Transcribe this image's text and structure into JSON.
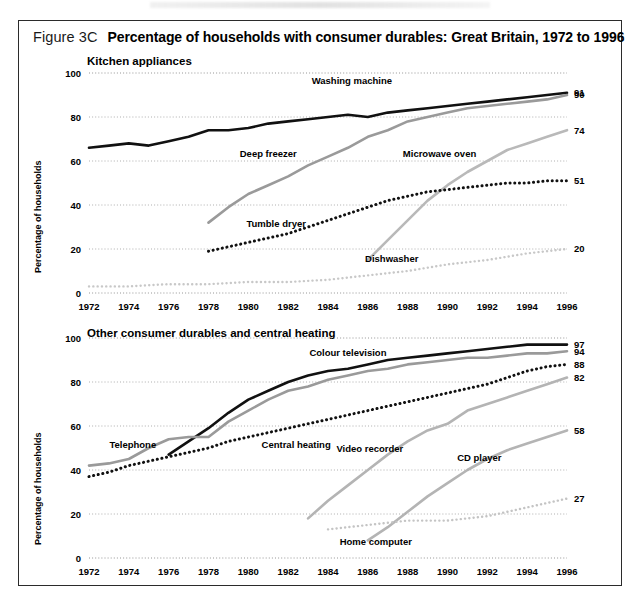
{
  "figure": {
    "number": "Figure 3C",
    "title": "Percentage of households with consumer durables: Great Britain, 1972 to 1996"
  },
  "chart_data": [
    {
      "type": "line",
      "title": "Kitchen appliances",
      "xlabel": "",
      "ylabel": "Percentage of households",
      "xlim": [
        1972,
        1996
      ],
      "ylim": [
        0,
        100
      ],
      "yticks": [
        0,
        20,
        40,
        60,
        80,
        100
      ],
      "grid": true,
      "legend": "inline-labels",
      "categories": [
        1972,
        1974,
        1976,
        1978,
        1980,
        1982,
        1984,
        1986,
        1988,
        1990,
        1992,
        1994,
        1996
      ],
      "series": [
        {
          "name": "Washing machine",
          "style": "solid-black",
          "color": "#111111",
          "end_value": 91,
          "label_x": 1985.2,
          "label_y": 95,
          "x": [
            1972,
            1973,
            1974,
            1975,
            1976,
            1977,
            1978,
            1979,
            1980,
            1981,
            1982,
            1983,
            1984,
            1985,
            1986,
            1987,
            1988,
            1989,
            1990,
            1991,
            1992,
            1993,
            1994,
            1995,
            1996
          ],
          "values": [
            66,
            67,
            68,
            67,
            69,
            71,
            74,
            74,
            75,
            77,
            78,
            79,
            80,
            81,
            80,
            82,
            83,
            84,
            85,
            86,
            87,
            88,
            89,
            90,
            91
          ]
        },
        {
          "name": "Deep freezer",
          "style": "solid-grey",
          "color": "#9a9a9a",
          "end_value": 90,
          "label_x": 1981.0,
          "label_y": 62,
          "x": [
            1978,
            1979,
            1980,
            1981,
            1982,
            1983,
            1984,
            1985,
            1986,
            1987,
            1988,
            1989,
            1990,
            1991,
            1992,
            1993,
            1994,
            1995,
            1996
          ],
          "values": [
            32,
            39,
            45,
            49,
            53,
            58,
            62,
            66,
            71,
            74,
            78,
            80,
            82,
            84,
            85,
            86,
            87,
            88,
            90
          ]
        },
        {
          "name": "Microwave oven",
          "style": "solid-lightgrey",
          "color": "#b9b9b9",
          "end_value": 74,
          "label_x": 1989.6,
          "label_y": 62,
          "x": [
            1986,
            1987,
            1988,
            1989,
            1990,
            1991,
            1992,
            1993,
            1994,
            1995,
            1996
          ],
          "values": [
            15,
            24,
            33,
            42,
            49,
            55,
            60,
            65,
            68,
            71,
            74
          ]
        },
        {
          "name": "Tumble dryer",
          "style": "dotted-black",
          "color": "#111111",
          "end_value": 51,
          "label_x": 1981.4,
          "label_y": 30,
          "x": [
            1978,
            1979,
            1980,
            1981,
            1982,
            1983,
            1984,
            1985,
            1986,
            1987,
            1988,
            1989,
            1990,
            1991,
            1992,
            1993,
            1994,
            1995,
            1996
          ],
          "values": [
            19,
            21,
            23,
            25,
            27,
            30,
            33,
            36,
            39,
            42,
            44,
            46,
            47,
            48,
            49,
            50,
            50,
            51,
            51
          ]
        },
        {
          "name": "Dishwasher",
          "style": "dotted-lightgrey",
          "color": "#c8c8c8",
          "end_value": 20,
          "label_x": 1987.2,
          "label_y": 14,
          "x": [
            1972,
            1974,
            1976,
            1978,
            1980,
            1982,
            1984,
            1986,
            1988,
            1990,
            1992,
            1994,
            1996
          ],
          "values": [
            3,
            3,
            4,
            4,
            5,
            5,
            6,
            8,
            10,
            13,
            15,
            18,
            20
          ]
        }
      ]
    },
    {
      "type": "line",
      "title": "Other consumer durables and central heating",
      "xlabel": "",
      "ylabel": "Percentage of households",
      "xlim": [
        1972,
        1996
      ],
      "ylim": [
        0,
        100
      ],
      "yticks": [
        0,
        20,
        40,
        60,
        80,
        100
      ],
      "grid": true,
      "legend": "inline-labels",
      "categories": [
        1972,
        1974,
        1976,
        1978,
        1980,
        1982,
        1984,
        1986,
        1988,
        1990,
        1992,
        1994,
        1996
      ],
      "series": [
        {
          "name": "Colour television",
          "style": "solid-black",
          "color": "#111111",
          "end_value": 97,
          "label_x": 1985.0,
          "label_y": 92,
          "x": [
            1976,
            1977,
            1978,
            1979,
            1980,
            1981,
            1982,
            1983,
            1984,
            1985,
            1986,
            1987,
            1988,
            1989,
            1990,
            1991,
            1992,
            1993,
            1994,
            1995,
            1996
          ],
          "values": [
            47,
            53,
            59,
            66,
            72,
            76,
            80,
            83,
            85,
            86,
            88,
            90,
            91,
            92,
            93,
            94,
            95,
            96,
            97,
            97,
            97
          ]
        },
        {
          "name": "Telephone",
          "style": "solid-grey",
          "color": "#9a9a9a",
          "end_value": 94,
          "label_x": 1974.2,
          "label_y": 50,
          "x": [
            1972,
            1973,
            1974,
            1975,
            1976,
            1977,
            1978,
            1979,
            1980,
            1981,
            1982,
            1983,
            1984,
            1985,
            1986,
            1987,
            1988,
            1989,
            1990,
            1991,
            1992,
            1993,
            1994,
            1995,
            1996
          ],
          "values": [
            42,
            43,
            45,
            50,
            54,
            55,
            55,
            62,
            67,
            72,
            76,
            78,
            81,
            83,
            85,
            86,
            88,
            89,
            90,
            91,
            91,
            92,
            93,
            93,
            94
          ]
        },
        {
          "name": "Central heating",
          "style": "dotted-black",
          "color": "#111111",
          "end_value": 88,
          "label_x": 1982.4,
          "label_y": 50,
          "x": [
            1972,
            1973,
            1974,
            1975,
            1976,
            1977,
            1978,
            1979,
            1980,
            1981,
            1982,
            1983,
            1984,
            1985,
            1986,
            1987,
            1988,
            1989,
            1990,
            1991,
            1992,
            1993,
            1994,
            1995,
            1996
          ],
          "values": [
            37,
            39,
            42,
            44,
            46,
            48,
            50,
            53,
            55,
            57,
            59,
            61,
            63,
            65,
            67,
            69,
            71,
            73,
            75,
            77,
            79,
            82,
            85,
            87,
            88
          ]
        },
        {
          "name": "Video recorder",
          "style": "solid-lightgrey",
          "color": "#b4b4b4",
          "end_value": 82,
          "label_x": 1986.1,
          "label_y": 48,
          "x": [
            1983,
            1984,
            1985,
            1986,
            1987,
            1988,
            1989,
            1990,
            1991,
            1992,
            1993,
            1994,
            1995,
            1996
          ],
          "values": [
            18,
            26,
            33,
            40,
            47,
            53,
            58,
            61,
            67,
            70,
            73,
            76,
            79,
            82
          ]
        },
        {
          "name": "CD player",
          "style": "solid-lightgrey-2",
          "color": "#b4b4b4",
          "end_value": 58,
          "label_x": 1991.6,
          "label_y": 44,
          "x": [],
          "values": []
        },
        {
          "name": "Home computer",
          "style": "dotted-lightgrey",
          "color": "#c4c4c4",
          "end_value": 27,
          "label_x": 1986.4,
          "label_y": 6,
          "x": [
            1984,
            1985,
            1986,
            1987,
            1988,
            1989,
            1990,
            1991,
            1992,
            1993,
            1994,
            1995,
            1996
          ],
          "values": [
            13,
            14,
            15,
            16,
            17,
            17,
            17,
            18,
            19,
            21,
            23,
            25,
            27
          ]
        }
      ]
    }
  ]
}
